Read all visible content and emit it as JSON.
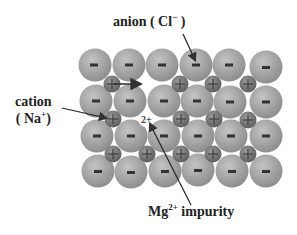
{
  "diagram": {
    "labels": {
      "anion": {
        "text": "anion ( Cl",
        "sup": "−",
        "tail": " )"
      },
      "cation": {
        "line1": "cation",
        "line2_pre": "( Na",
        "sup": "+",
        "line2_post": ")"
      },
      "impurity": {
        "pre": "Mg",
        "sup": "2+",
        "post": " impurity"
      },
      "impurity_site_mark": "2+"
    },
    "anion_symbol": "−",
    "cation_symbol": "+",
    "colors": {
      "anion_fill": "#a8a8a8",
      "cation_fill": "#7a7a7a",
      "arrow": "#333333",
      "text": "#222222"
    },
    "lattice": {
      "anion_rows": 4,
      "anions_per_row": 6,
      "cation_rows": 3,
      "cations_per_row": 5,
      "vacancy": {
        "row": 0,
        "col": 1
      },
      "impurity": {
        "row": 1,
        "col": 1
      }
    }
  }
}
